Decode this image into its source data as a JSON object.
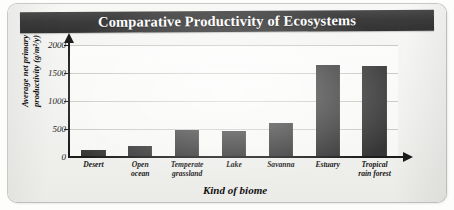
{
  "chart_data": {
    "type": "bar",
    "title": "Comparative Productivity of Ecosystems",
    "xlabel": "Kind of biome",
    "ylabel": "Average net primary productivity (g/m²/y)",
    "ylabel_line1": "Average net primary",
    "ylabel_line2": "productivity (g/m²/y)",
    "categories": [
      "Desert",
      "Open ocean",
      "Temperate grassland",
      "Lake",
      "Savanna",
      "Estuary",
      "Tropical rain forest"
    ],
    "category_lines": [
      [
        "Desert"
      ],
      [
        "Open",
        "ocean"
      ],
      [
        "Temperate",
        "grassland"
      ],
      [
        "Lake"
      ],
      [
        "Savanna"
      ],
      [
        "Estuary"
      ],
      [
        "Tropical",
        "rain forest"
      ]
    ],
    "values": [
      125,
      200,
      480,
      470,
      600,
      1650,
      1620
    ],
    "ylim": [
      0,
      2000
    ],
    "yticks": [
      0,
      500,
      1000,
      1500,
      2000
    ],
    "ytick_labels": [
      "0",
      "500",
      "1000",
      "1500",
      "2000"
    ],
    "grid": true,
    "legend": "none",
    "bar_color": "#363636",
    "plot_background": "#f9f9f7",
    "title_banner_color": "#3c3c3c",
    "title_text_color": "#ffffff",
    "axis_color": "#1c1c1c",
    "gridline_color": "#c9c9c6"
  }
}
